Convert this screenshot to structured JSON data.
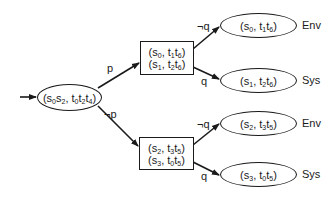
{
  "root": {
    "label": "(s0s2, t0t2t4)",
    "parts": [
      "(s",
      "0",
      "s",
      "2",
      ", t",
      "0",
      "t",
      "2",
      "t",
      "4",
      ")"
    ]
  },
  "box_top": {
    "lines": [
      {
        "label": "(s0, t1t6)",
        "parts": [
          "(s",
          "0",
          ", t",
          "1",
          "t",
          "6",
          ")"
        ]
      },
      {
        "label": "(s1, t2t6)",
        "parts": [
          "(s",
          "1",
          ", t",
          "2",
          "t",
          "6",
          ")"
        ]
      }
    ]
  },
  "box_bottom": {
    "lines": [
      {
        "label": "(s2, t3t5)",
        "parts": [
          "(s",
          "2",
          ", t",
          "3",
          "t",
          "5",
          ")"
        ]
      },
      {
        "label": "(s3, t0t5)",
        "parts": [
          "(s",
          "3",
          ", t",
          "0",
          "t",
          "5",
          ")"
        ]
      }
    ]
  },
  "leaves": [
    {
      "label": "(s0, t1t6)",
      "parts": [
        "(s",
        "0",
        ", t",
        "1",
        "t",
        "6",
        ")"
      ],
      "player": "Env"
    },
    {
      "label": "(s1, t2t6)",
      "parts": [
        "(s",
        "1",
        ", t",
        "2",
        "t",
        "6",
        ")"
      ],
      "player": "Sys"
    },
    {
      "label": "(s2, t3t5)",
      "parts": [
        "(s",
        "2",
        ", t",
        "3",
        "t",
        "5",
        ")"
      ],
      "player": "Env"
    },
    {
      "label": "(s3, t0t5)",
      "parts": [
        "(s",
        "3",
        ", t",
        "0",
        "t",
        "5",
        ")"
      ],
      "player": "Sys"
    }
  ],
  "edge_labels": {
    "root_to_top": "p",
    "root_to_bottom": "¬p",
    "top_to_leaf0": "¬q",
    "top_to_leaf1": "q",
    "bottom_to_leaf2": "¬q",
    "bottom_to_leaf3": "q"
  },
  "colors": {
    "stroke": "#1a1a1a",
    "background": "#ffffff"
  }
}
